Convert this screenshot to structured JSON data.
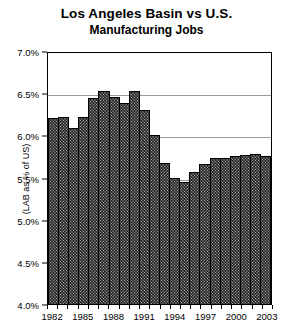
{
  "chart_data": {
    "type": "bar",
    "title": "Los Angeles Basin vs U.S.",
    "subtitle": "Manufacturing Jobs",
    "xlabel": "",
    "ylabel": "(LAB as % of US)",
    "ylim": [
      4.0,
      7.0
    ],
    "ytick_step": 0.5,
    "ytick_labels": [
      "7.0%",
      "6.5%",
      "6.0%",
      "5.5%",
      "5.0%",
      "4.5%",
      "4.0%"
    ],
    "ytick_values": [
      7.0,
      6.5,
      6.0,
      5.5,
      5.0,
      4.5,
      4.0
    ],
    "grid": "horizontal",
    "legend": "none",
    "xtick_labels": [
      "1982",
      "1985",
      "1988",
      "1991",
      "1994",
      "1997",
      "2000",
      "2003"
    ],
    "xtick_values": [
      1982,
      1985,
      1988,
      1991,
      1994,
      1997,
      2000,
      2003
    ],
    "categories": [
      "1982",
      "1983",
      "1984",
      "1985",
      "1986",
      "1987",
      "1988",
      "1989",
      "1990",
      "1991",
      "1992",
      "1993",
      "1994",
      "1995",
      "1996",
      "1997",
      "1998",
      "1999",
      "2000",
      "2001",
      "2002",
      "2003"
    ],
    "values": [
      6.2,
      6.22,
      6.09,
      6.22,
      6.44,
      6.53,
      6.45,
      6.38,
      6.53,
      6.3,
      6.0,
      5.67,
      5.49,
      5.45,
      5.57,
      5.66,
      5.73,
      5.73,
      5.75,
      5.77,
      5.78,
      5.75
    ],
    "bar_fill_color": "#a8a8a8",
    "bar_edge_color": "#000000",
    "bar_hatch": "cross-hatch",
    "gridline_color": "#9a9a9a",
    "background_color": "#ffffff"
  }
}
